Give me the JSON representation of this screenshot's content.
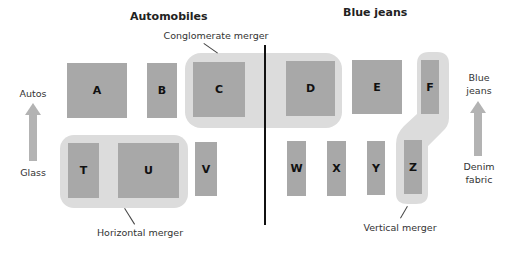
{
  "headings": {
    "automobiles": "Automobiles",
    "blue_jeans": "Blue jeans"
  },
  "merger_labels": {
    "conglomerate": "Conglomerate merger",
    "horizontal": "Horizontal merger",
    "vertical": "Vertical merger"
  },
  "left_axis": {
    "top": "Autos",
    "bottom": "Glass"
  },
  "right_axis": {
    "top_line1": "Blue",
    "top_line2": "jeans",
    "bottom_line1": "Denim",
    "bottom_line2": "fabric"
  },
  "firms": {
    "top_row": [
      "A",
      "B",
      "C",
      "D",
      "E",
      "F"
    ],
    "bottom_row": [
      "T",
      "U",
      "V",
      "W",
      "X",
      "Y",
      "Z"
    ]
  },
  "colors": {
    "firm_box": "#a8a8a8",
    "merger_highlight": "#dcdcdc",
    "divider": "#111111"
  }
}
